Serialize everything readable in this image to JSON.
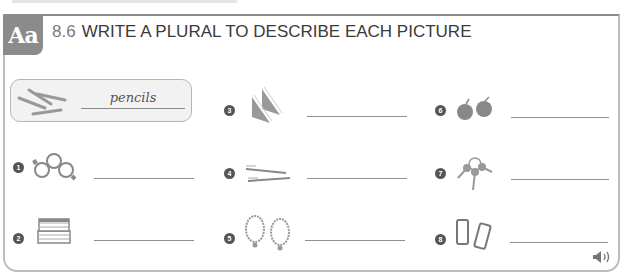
{
  "header": {
    "badge": "Aa",
    "exercise_number": "8.6",
    "title": "WRITE A PLURAL TO DESCRIBE EACH PICTURE"
  },
  "example": {
    "picture": "pencils-icon",
    "answer": "pencils"
  },
  "items": [
    {
      "number": "1",
      "picture": "watches-icon",
      "answer": ""
    },
    {
      "number": "2",
      "picture": "books-icon",
      "answer": ""
    },
    {
      "number": "3",
      "picture": "sandwiches-icon",
      "answer": ""
    },
    {
      "number": "4",
      "picture": "toothbrushes-icon",
      "answer": ""
    },
    {
      "number": "5",
      "picture": "necklaces-icon",
      "answer": ""
    },
    {
      "number": "6",
      "picture": "apples-icon",
      "answer": ""
    },
    {
      "number": "7",
      "picture": "keys-icon",
      "answer": ""
    },
    {
      "number": "8",
      "picture": "phones-icon",
      "answer": ""
    }
  ],
  "audio": {
    "icon": "speaker-icon"
  },
  "colors": {
    "badge": "#8b8b8b",
    "border": "#bdbdbd",
    "text": "#3a3a3a"
  }
}
